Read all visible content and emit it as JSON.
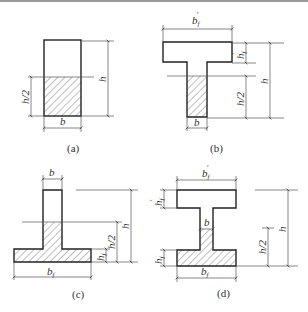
{
  "figure": {
    "panels": [
      {
        "id": "a",
        "caption": "(a)",
        "shape": "rectangle",
        "labels": {
          "width": "b",
          "height": "h",
          "half_height": "h/2"
        }
      },
      {
        "id": "b",
        "caption": "(b)",
        "shape": "T-section",
        "labels": {
          "flange_width": "b′f",
          "flange_thickness": "h′f",
          "web_width": "b",
          "height": "h",
          "half_height": "h/2"
        }
      },
      {
        "id": "c",
        "caption": "(c)",
        "shape": "inverted-T-section",
        "labels": {
          "web_width": "b",
          "flange_width": "bf",
          "flange_thickness": "hf",
          "height": "h",
          "half_height": "h/2"
        }
      },
      {
        "id": "d",
        "caption": "(d)",
        "shape": "I-section",
        "labels": {
          "top_flange_width": "b′f",
          "top_flange_thickness": "h′f",
          "web_width": "b",
          "bottom_flange_width": "bf",
          "bottom_flange_thickness": "hf",
          "height": "h",
          "half_height": "h/2"
        }
      }
    ]
  },
  "labels": {
    "a_b": "b",
    "a_h": "h",
    "a_h2": "h/2",
    "a_cap": "(a)",
    "b_bf": "b",
    "b_bf_sub": "f",
    "b_hf": "h",
    "b_hf_sub": "f",
    "b_b": "b",
    "b_h": "h",
    "b_h2": "h/2",
    "b_cap": "(b)",
    "c_b": "b",
    "c_bf": "b",
    "c_bf_sub": "f",
    "c_hf": "h",
    "c_hf_sub": "f",
    "c_h": "h",
    "c_h2": "h/2",
    "c_cap": "(c)",
    "d_bf_top": "b",
    "d_bf_top_sub": "f",
    "d_hf_top": "h",
    "d_hf_top_sub": "f",
    "d_b": "b",
    "d_hf_bot": "h",
    "d_hf_bot_sub": "f",
    "d_bf_bot": "b",
    "d_bf_bot_sub": "f",
    "d_h": "h",
    "d_h2": "h/2",
    "d_cap": "(d)"
  },
  "colors": {
    "line": "#333333",
    "background": "#ffffff",
    "topbar": "#9a9a9a"
  }
}
